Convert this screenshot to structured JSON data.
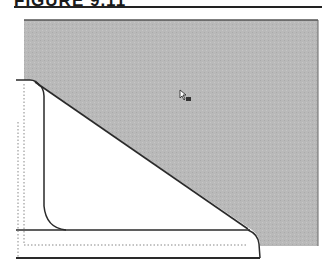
{
  "figure": {
    "title": "FIGURE 9.11"
  },
  "diagram": {
    "background_region": {
      "fill": "#b9b9b9",
      "border": "#555555"
    },
    "shape": {
      "fill": "#ffffff",
      "stroke": "#2a2a2a"
    },
    "guides": {
      "stroke": "#888888",
      "style": "dotted"
    },
    "cursor": {
      "icon": "pointer-with-badge-icon"
    }
  }
}
